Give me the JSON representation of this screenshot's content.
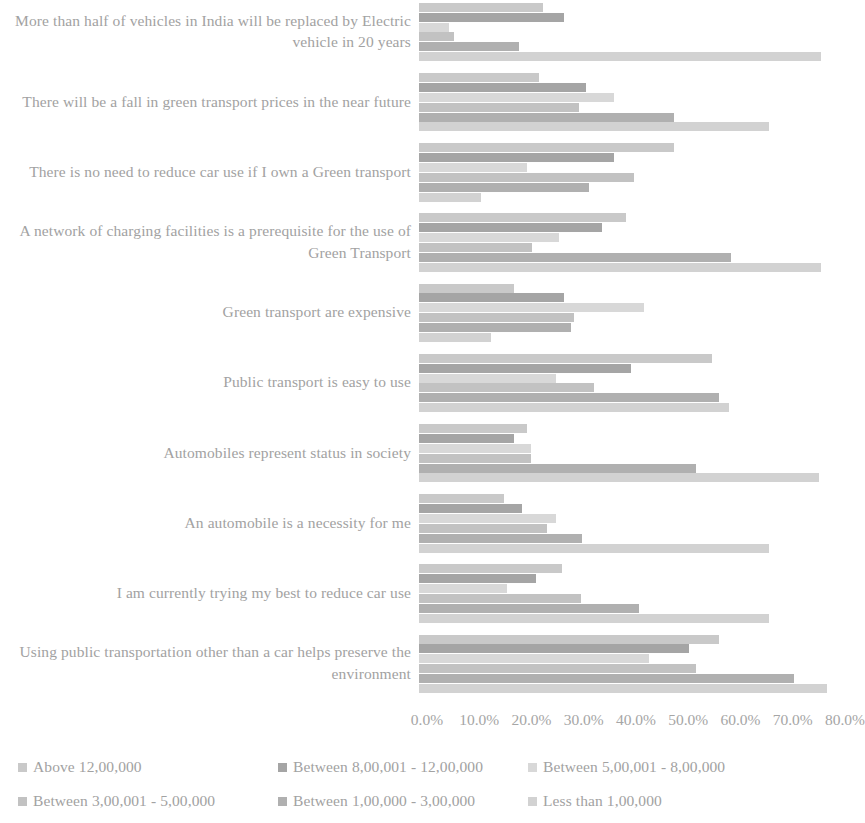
{
  "chart_data": {
    "type": "bar",
    "orientation": "horizontal",
    "title": "",
    "xlabel": "",
    "ylabel": "",
    "xlim": [
      0,
      80
    ],
    "grid": false,
    "legend_position": "bottom",
    "xticks": [
      "0.0%",
      "10.0%",
      "20.0%",
      "30.0%",
      "40.0%",
      "50.0%",
      "60.0%",
      "70.0%",
      "80.0%"
    ],
    "xtick_values": [
      0,
      10,
      20,
      30,
      40,
      50,
      60,
      70,
      80
    ],
    "categories": [
      "More than half of vehicles in India will be replaced by Electric vehicle in 20 years",
      "There will be a fall in green transport prices in the near future",
      "There is no need to reduce car use if I own a Green transport",
      "A network of charging facilities is a prerequisite for the use of Green Transport",
      "Green transport are expensive",
      "Public transport is easy to use",
      "Automobiles represent status in society",
      "An automobile is a necessity for me",
      "I am currently trying my best to reduce car use",
      "Using public transportation other than a car helps preserve the environment"
    ],
    "series": [
      {
        "name": "Above 12,00,000",
        "color": "#c9c9c9",
        "values": [
          23.8,
          23.0,
          48.8,
          39.6,
          18.2,
          56.0,
          20.6,
          16.2,
          27.4,
          57.4
        ]
      },
      {
        "name": "Between 8,00,001 - 12,00,000",
        "color": "#a5a5a5",
        "values": [
          27.8,
          32.0,
          37.3,
          35.0,
          27.8,
          40.6,
          18.2,
          19.7,
          22.4,
          51.7
        ]
      },
      {
        "name": "Between 5,00,001 - 8,00,000",
        "color": "#d8d8d8",
        "values": [
          5.7,
          37.3,
          20.7,
          26.8,
          43.1,
          26.2,
          21.4,
          26.2,
          16.8,
          44.0
        ]
      },
      {
        "name": "Between 3,00,001 - 5,00,000",
        "color": "#c2c2c2",
        "values": [
          6.7,
          30.6,
          41.1,
          21.6,
          29.7,
          33.5,
          21.4,
          24.5,
          31.0,
          53.0
        ]
      },
      {
        "name": "Between 1,00,000 - 3,00,000",
        "color": "#b0b0b0",
        "values": [
          19.1,
          48.8,
          32.5,
          59.7,
          29.1,
          57.4,
          53.0,
          31.2,
          42.1,
          71.8
        ]
      },
      {
        "name": "Less than 1,00,000",
        "color": "#d2d2d2",
        "values": [
          77.0,
          67.0,
          11.9,
          76.9,
          13.8,
          59.3,
          76.5,
          67.0,
          67.0,
          78.0
        ]
      }
    ]
  },
  "legend": {
    "items": [
      {
        "label": "Above 12,00,000",
        "color": "#c9c9c9"
      },
      {
        "label": "Between 8,00,001 - 12,00,000",
        "color": "#a5a5a5"
      },
      {
        "label": "Between 5,00,001 - 8,00,000",
        "color": "#d8d8d8"
      },
      {
        "label": "Between 3,00,001 - 5,00,000",
        "color": "#c2c2c2"
      },
      {
        "label": "Between 1,00,000 - 3,00,000",
        "color": "#b0b0b0"
      },
      {
        "label": "Less than 1,00,000",
        "color": "#d2d2d2"
      }
    ]
  }
}
